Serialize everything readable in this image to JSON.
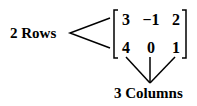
{
  "rows_label": "2 Rows",
  "columns_label": "3 Columns",
  "matrix": {
    "rows": [
      [
        "3",
        "−1",
        "2"
      ],
      [
        "4",
        "0",
        "1"
      ]
    ]
  }
}
